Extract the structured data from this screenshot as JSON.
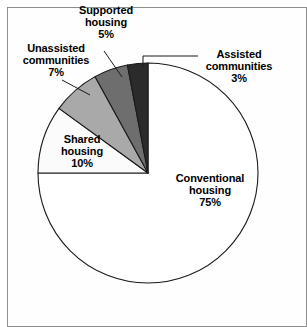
{
  "figure": {
    "background_color": "#ffffff",
    "frame_color": "#8e8e8e",
    "outline_color": "#1a1a1a"
  },
  "chart_data": {
    "type": "pie",
    "title": "",
    "subtitle": "",
    "xlabel": "",
    "ylabel": "",
    "legend_position": "none",
    "grid": false,
    "units": "percent",
    "total": 100,
    "start_angle_deg": 0,
    "direction": "clockwise",
    "categories": [
      "Conventional housing",
      "Shared housing",
      "Unassisted communities",
      "Supported housing",
      "Assisted communities"
    ],
    "values": [
      75,
      10,
      7,
      5,
      3
    ],
    "slices": [
      {
        "name": "conventional-housing",
        "label": "Conventional\nhousing",
        "label_line1": "Conventional",
        "label_line2": "housing",
        "value": 75,
        "value_text": "75%",
        "color": "#ffffff",
        "label_placement": "inside"
      },
      {
        "name": "shared-housing",
        "label": "Shared\nhousing",
        "label_line1": "Shared",
        "label_line2": "housing",
        "value": 10,
        "value_text": "10%",
        "color": "#fbfbfb",
        "label_placement": "inside"
      },
      {
        "name": "unassisted-communities",
        "label": "Unassisted\ncommunities",
        "label_line1": "Unassisted",
        "label_line2": "communities",
        "value": 7,
        "value_text": "7%",
        "color": "#a9a9a9",
        "label_placement": "outside"
      },
      {
        "name": "supported-housing",
        "label": "Supported\nhousing",
        "label_line1": "Supported",
        "label_line2": "housing",
        "value": 5,
        "value_text": "5%",
        "color": "#6e6e6e",
        "label_placement": "outside"
      },
      {
        "name": "assisted-communities",
        "label": "Assisted\ncommunities",
        "label_line1": "Assisted",
        "label_line2": "communities",
        "value": 3,
        "value_text": "3%",
        "color": "#2b2b2b",
        "label_placement": "outside"
      }
    ]
  }
}
